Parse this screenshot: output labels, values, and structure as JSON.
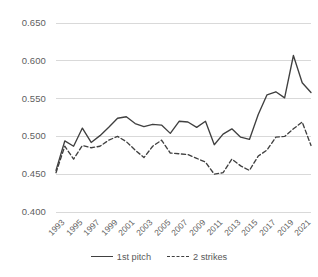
{
  "chart_data": {
    "type": "line",
    "title": "",
    "xlabel": "",
    "ylabel": "",
    "ylim": [
      0.4,
      0.65
    ],
    "ytick_step": 0.05,
    "ytick_labels": [
      "0.650",
      "0.600",
      "0.550",
      "0.500",
      "0.450",
      "0.400"
    ],
    "ytick_values": [
      0.65,
      0.6,
      0.55,
      0.5,
      0.45,
      0.4
    ],
    "grid": "horizontal",
    "legend_position": "bottom",
    "x": [
      1993,
      1994,
      1995,
      1996,
      1997,
      1998,
      1999,
      2000,
      2001,
      2002,
      2003,
      2004,
      2005,
      2006,
      2007,
      2008,
      2009,
      2010,
      2011,
      2012,
      2013,
      2014,
      2015,
      2016,
      2017,
      2018,
      2019,
      2020,
      2021,
      2022
    ],
    "xtick_labels": [
      "1993",
      "1995",
      "1997",
      "1999",
      "2001",
      "2003",
      "2005",
      "2007",
      "2009",
      "2011",
      "2013",
      "2015",
      "2017",
      "2019",
      "2021"
    ],
    "xtick_values": [
      1993,
      1995,
      1997,
      1999,
      2001,
      2003,
      2005,
      2007,
      2009,
      2011,
      2013,
      2015,
      2017,
      2019,
      2021
    ],
    "series": [
      {
        "name": "1st pitch",
        "style": "solid",
        "color": "#404040",
        "values": [
          0.455,
          0.494,
          0.487,
          0.511,
          0.492,
          0.501,
          0.512,
          0.524,
          0.526,
          0.517,
          0.513,
          0.516,
          0.515,
          0.504,
          0.52,
          0.519,
          0.512,
          0.52,
          0.489,
          0.503,
          0.51,
          0.499,
          0.496,
          0.529,
          0.555,
          0.559,
          0.551,
          0.607,
          0.571,
          0.558
        ]
      },
      {
        "name": "2 strikes",
        "style": "dashed",
        "color": "#404040",
        "values": [
          0.452,
          0.487,
          0.47,
          0.488,
          0.485,
          0.487,
          0.495,
          0.5,
          0.493,
          0.482,
          0.472,
          0.487,
          0.495,
          0.478,
          0.477,
          0.476,
          0.471,
          0.466,
          0.45,
          0.452,
          0.47,
          0.461,
          0.455,
          0.474,
          0.482,
          0.499,
          0.5,
          0.51,
          0.519,
          0.488
        ]
      }
    ]
  },
  "legend": {
    "items": [
      {
        "label": "1st pitch",
        "style": "solid"
      },
      {
        "label": "2 strikes",
        "style": "dashed"
      }
    ]
  }
}
